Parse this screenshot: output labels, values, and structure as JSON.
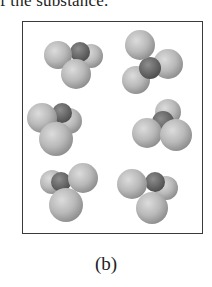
{
  "top_text": "f the substance.",
  "figure": {
    "caption": "(b)",
    "colors": {
      "outer_atom": "#b8b8b8",
      "outer_atom_highlight": "#d6d6d6",
      "central_atom": "#6e6e6e",
      "frame": "#3a3a3a"
    },
    "molecules": [
      {
        "id": "molecule-1",
        "atoms": [
          {
            "role": "outer",
            "cx": 91,
            "cy": 56,
            "r": 12
          },
          {
            "role": "central",
            "cx": 80,
            "cy": 52,
            "r": 10
          },
          {
            "role": "outer",
            "cx": 58,
            "cy": 55,
            "r": 14
          },
          {
            "role": "outer",
            "cx": 76,
            "cy": 74,
            "r": 15
          }
        ]
      },
      {
        "id": "molecule-2",
        "atoms": [
          {
            "role": "outer",
            "cx": 168,
            "cy": 64,
            "r": 15
          },
          {
            "role": "outer",
            "cx": 136,
            "cy": 80,
            "r": 14
          },
          {
            "role": "central",
            "cx": 150,
            "cy": 68,
            "r": 11
          },
          {
            "role": "outer",
            "cx": 140,
            "cy": 45,
            "r": 15
          }
        ]
      },
      {
        "id": "molecule-3",
        "atoms": [
          {
            "role": "outer",
            "cx": 69,
            "cy": 121,
            "r": 13
          },
          {
            "role": "central",
            "cx": 62,
            "cy": 113,
            "r": 10
          },
          {
            "role": "outer",
            "cx": 42,
            "cy": 118,
            "r": 15
          },
          {
            "role": "outer",
            "cx": 56,
            "cy": 139,
            "r": 17
          }
        ]
      },
      {
        "id": "molecule-4",
        "atoms": [
          {
            "role": "outer",
            "cx": 168,
            "cy": 112,
            "r": 13
          },
          {
            "role": "central",
            "cx": 163,
            "cy": 122,
            "r": 11
          },
          {
            "role": "outer",
            "cx": 147,
            "cy": 133,
            "r": 15
          },
          {
            "role": "outer",
            "cx": 176,
            "cy": 135,
            "r": 16
          }
        ]
      },
      {
        "id": "molecule-5",
        "atoms": [
          {
            "role": "outer",
            "cx": 52,
            "cy": 182,
            "r": 12
          },
          {
            "role": "central",
            "cx": 61,
            "cy": 182,
            "r": 10
          },
          {
            "role": "outer",
            "cx": 83,
            "cy": 178,
            "r": 15
          },
          {
            "role": "outer",
            "cx": 66,
            "cy": 205,
            "r": 17
          }
        ]
      },
      {
        "id": "molecule-6",
        "atoms": [
          {
            "role": "outer",
            "cx": 166,
            "cy": 188,
            "r": 12
          },
          {
            "role": "central",
            "cx": 155,
            "cy": 182,
            "r": 10
          },
          {
            "role": "outer",
            "cx": 132,
            "cy": 184,
            "r": 15
          },
          {
            "role": "outer",
            "cx": 152,
            "cy": 208,
            "r": 16
          }
        ]
      }
    ]
  }
}
